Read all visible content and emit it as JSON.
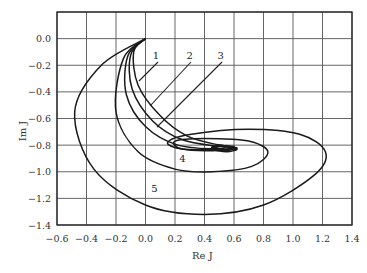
{
  "chart_data": {
    "type": "line",
    "title": "",
    "xlabel": "Re J",
    "ylabel": "Im J",
    "xlim": [
      -0.6,
      1.4
    ],
    "ylim": [
      -1.4,
      0.2
    ],
    "grid": true,
    "legend": "none (numbered curve labels 1-5 with leader lines)",
    "x_ticks": [
      "-0.6",
      "-0.4",
      "-0.2",
      "0.0",
      "0.2",
      "0.4",
      "0.6",
      "0.8",
      "1.0",
      "1.2",
      "1.4"
    ],
    "y_ticks": [
      "0.0",
      "-0.2",
      "-0.4",
      "-0.6",
      "-0.8",
      "-1.0",
      "-1.2",
      "-1.4"
    ],
    "series": [
      {
        "name": "1",
        "points": [
          [
            0.0,
            0.0
          ],
          [
            -0.08,
            -0.1
          ],
          [
            -0.05,
            -0.35
          ],
          [
            0.1,
            -0.58
          ],
          [
            0.28,
            -0.73
          ],
          [
            0.5,
            -0.8
          ],
          [
            0.6,
            -0.81
          ],
          [
            0.55,
            -0.83
          ],
          [
            0.45,
            -0.82
          ],
          [
            0.5,
            -0.8
          ]
        ]
      },
      {
        "name": "2",
        "points": [
          [
            0.0,
            0.0
          ],
          [
            -0.1,
            -0.12
          ],
          [
            -0.09,
            -0.38
          ],
          [
            0.05,
            -0.62
          ],
          [
            0.25,
            -0.76
          ],
          [
            0.5,
            -0.81
          ],
          [
            0.62,
            -0.82
          ],
          [
            0.55,
            -0.84
          ],
          [
            0.45,
            -0.82
          ],
          [
            0.5,
            -0.8
          ]
        ]
      },
      {
        "name": "3",
        "points": [
          [
            0.0,
            0.0
          ],
          [
            -0.12,
            -0.13
          ],
          [
            -0.13,
            -0.42
          ],
          [
            0.0,
            -0.66
          ],
          [
            0.22,
            -0.8
          ],
          [
            0.5,
            -0.83
          ],
          [
            0.62,
            -0.83
          ],
          [
            0.55,
            -0.85
          ],
          [
            0.45,
            -0.83
          ],
          [
            0.5,
            -0.81
          ]
        ]
      },
      {
        "name": "4",
        "points": [
          [
            0.0,
            0.0
          ],
          [
            -0.15,
            -0.15
          ],
          [
            -0.2,
            -0.55
          ],
          [
            -0.05,
            -0.85
          ],
          [
            0.2,
            -0.98
          ],
          [
            0.45,
            -1.0
          ],
          [
            0.72,
            -0.96
          ],
          [
            0.83,
            -0.85
          ],
          [
            0.7,
            -0.77
          ],
          [
            0.4,
            -0.75
          ],
          [
            0.2,
            -0.77
          ],
          [
            0.25,
            -0.83
          ],
          [
            0.5,
            -0.84
          ],
          [
            0.62,
            -0.82
          ],
          [
            0.5,
            -0.8
          ]
        ]
      },
      {
        "name": "5",
        "points": [
          [
            0.0,
            0.0
          ],
          [
            -0.3,
            -0.2
          ],
          [
            -0.48,
            -0.55
          ],
          [
            -0.35,
            -0.98
          ],
          [
            0.0,
            -1.25
          ],
          [
            0.4,
            -1.32
          ],
          [
            0.8,
            -1.25
          ],
          [
            1.15,
            -1.02
          ],
          [
            1.22,
            -0.85
          ],
          [
            1.05,
            -0.72
          ],
          [
            0.7,
            -0.68
          ],
          [
            0.3,
            -0.72
          ],
          [
            0.15,
            -0.78
          ],
          [
            0.25,
            -0.83
          ],
          [
            0.5,
            -0.83
          ],
          [
            0.55,
            -0.8
          ]
        ]
      }
    ],
    "annotations": [
      {
        "text": "1",
        "x": 0.07,
        "y": -0.15
      },
      {
        "text": "2",
        "x": 0.3,
        "y": -0.15
      },
      {
        "text": "3",
        "x": 0.51,
        "y": -0.15
      },
      {
        "text": "4",
        "x": 0.25,
        "y": -0.93
      },
      {
        "text": "5",
        "x": 0.06,
        "y": -1.15
      }
    ]
  }
}
